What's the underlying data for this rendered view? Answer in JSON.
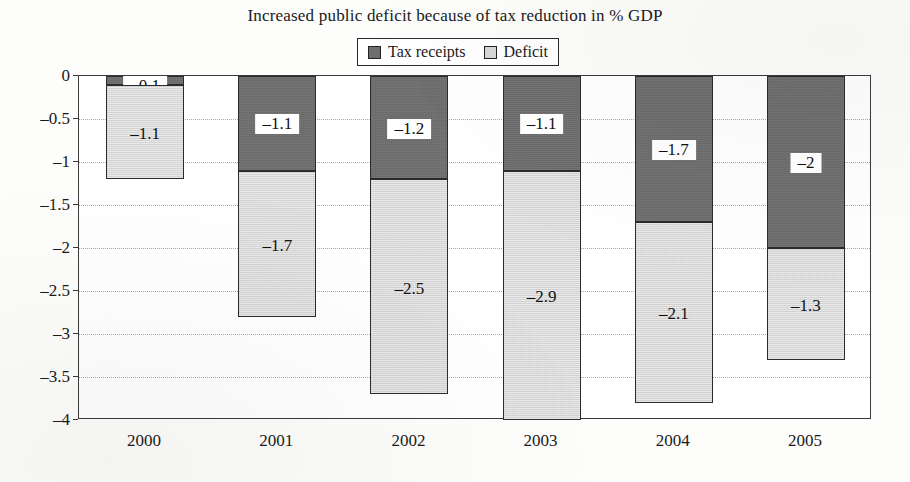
{
  "chart_data": {
    "type": "bar",
    "subtype": "stacked-bar",
    "title": "Increased public deficit because of tax reduction in % GDP",
    "xlabel": "",
    "ylabel": "",
    "categories": [
      "2000",
      "2001",
      "2002",
      "2003",
      "2004",
      "2005"
    ],
    "series": [
      {
        "name": "Tax receipts",
        "color": "#6e6e6e",
        "values": [
          -0.1,
          -1.1,
          -1.2,
          -1.1,
          -1.7,
          -2
        ],
        "labels": [
          "–0.1",
          "–1.1",
          "–1.2",
          "–1.1",
          "–1.7",
          "–2"
        ]
      },
      {
        "name": "Deficit",
        "color": "#d6d6d6",
        "values": [
          -1.1,
          -1.7,
          -2.5,
          -2.9,
          -2.1,
          -1.3
        ],
        "labels": [
          "–1.1",
          "–1.7",
          "–2.5",
          "–2.9",
          "–2.1",
          "–1.3"
        ]
      }
    ],
    "totals": [
      -1.2,
      -2.8,
      -3.7,
      -4.0,
      -3.8,
      -3.3
    ],
    "ylim": [
      -4,
      0
    ],
    "ytick_values": [
      0,
      -0.5,
      -1,
      -1.5,
      -2,
      -2.5,
      -3,
      -3.5,
      -4
    ],
    "ytick_labels": [
      "0",
      "–0.5",
      "–1",
      "–1.5",
      "–2",
      "–2.5",
      "–3",
      "–3.5",
      "–4"
    ],
    "grid": true,
    "grid_style": "dotted",
    "legend_position": "top-center",
    "legend_entries": [
      "Tax receipts",
      "Deficit"
    ]
  },
  "legend": {
    "items": [
      {
        "label": "Tax receipts",
        "swatch": "dark-gray-swatch-icon"
      },
      {
        "label": "Deficit",
        "swatch": "light-gray-swatch-icon"
      }
    ]
  }
}
